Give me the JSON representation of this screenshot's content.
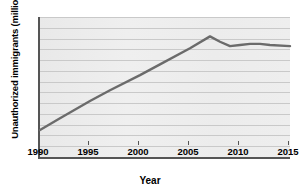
{
  "chart_data": {
    "type": "line",
    "title": "",
    "xlabel": "Year",
    "ylabel": "Unauthorized immigrants (millions)",
    "xlim": [
      1990,
      2015
    ],
    "ylim": [
      1,
      14
    ],
    "grid": true,
    "legend_position": "none",
    "line_color": "#6b6b6b",
    "plot_background": "#eeeeee",
    "gridline_color": "#c9c9c9",
    "axis_color": "#555555",
    "xticks": [
      1990,
      1995,
      2000,
      2005,
      2010,
      2015
    ],
    "xtick_labels": [
      "1990",
      "1995",
      "2000",
      "2005",
      "2010",
      "2015"
    ],
    "yticks": [
      1,
      2,
      3,
      4,
      5,
      6,
      7,
      8,
      9,
      10,
      11,
      12,
      13,
      14
    ],
    "ytick_labels": [
      "1",
      "2",
      "3",
      "4",
      "5",
      "6",
      "7",
      "8",
      "9",
      "10",
      "11",
      "12",
      "13",
      "14"
    ],
    "x": [
      1990,
      1992,
      1995,
      1997,
      2000,
      2002,
      2005,
      2007,
      2008,
      2009,
      2010,
      2011,
      2012,
      2013,
      2015
    ],
    "values": [
      3.5,
      4.6,
      6.2,
      7.2,
      8.6,
      9.6,
      11.1,
      12.2,
      11.7,
      11.3,
      11.4,
      11.5,
      11.5,
      11.4,
      11.3
    ],
    "series": [
      {
        "name": "Unauthorized immigrants",
        "values": [
          3.5,
          4.6,
          6.2,
          7.2,
          8.6,
          9.6,
          11.1,
          12.2,
          11.7,
          11.3,
          11.4,
          11.5,
          11.5,
          11.4,
          11.3
        ]
      }
    ],
    "annotations": []
  }
}
